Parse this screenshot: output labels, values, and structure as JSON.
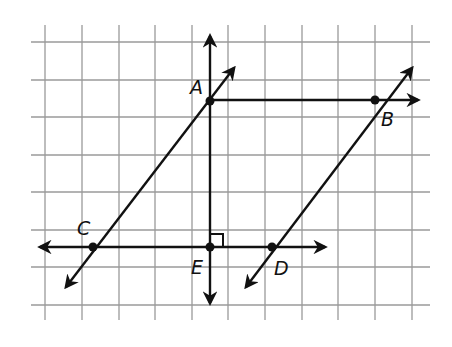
{
  "diagram": {
    "grid": {
      "x_lines": [
        45,
        82,
        119,
        155,
        192,
        228,
        265,
        302,
        338,
        375,
        412
      ],
      "y_lines": [
        42,
        80,
        117,
        155,
        192,
        230,
        267,
        305
      ],
      "x_extent": [
        31,
        430
      ],
      "y_extent": [
        25,
        320
      ],
      "color": "#999999"
    },
    "points": {
      "A": {
        "label": "A",
        "x": 210,
        "y": 101
      },
      "B": {
        "label": "B",
        "x": 375,
        "y": 100
      },
      "C": {
        "label": "C",
        "x": 93,
        "y": 247
      },
      "D": {
        "label": "D",
        "x": 272,
        "y": 247
      },
      "E": {
        "label": "E",
        "x": 210,
        "y": 247
      }
    },
    "lines": [
      {
        "name": "line-AE-vertical",
        "from": [
          210,
          303
        ],
        "to": [
          210,
          36
        ]
      },
      {
        "name": "line-CD-horizontal",
        "from": [
          40,
          247
        ],
        "to": [
          325,
          247
        ]
      },
      {
        "name": "ray-AB",
        "from": [
          210,
          100
        ],
        "to": [
          418,
          100
        ]
      },
      {
        "name": "line-AC",
        "from": [
          66,
          287
        ],
        "to": [
          234,
          68
        ]
      },
      {
        "name": "line-BD",
        "from": [
          246,
          287
        ],
        "to": [
          412,
          68
        ]
      }
    ],
    "right_angle_marker": {
      "at": "E"
    },
    "line_color": "#111111"
  }
}
